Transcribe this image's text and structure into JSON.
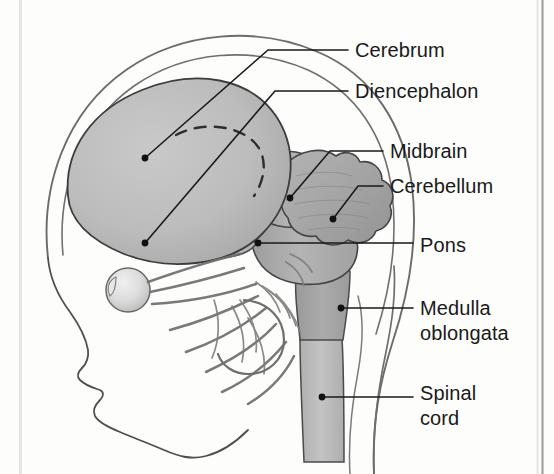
{
  "figure": {
    "background_color": "#fdfdfc",
    "ink_color": "#1a1a1a"
  },
  "palette": {
    "cerebrum_fill": "#b9b9b9",
    "cerebrum_fill_light": "#c7c7c7",
    "brainstem_fill": "#b0b0b0",
    "cerebellum_fill": "#a9a9a9",
    "medulla_fill": "#a6a6a6",
    "spinal_cord_fill": "#bcbcbc",
    "eye_fill": "#dcdcdc",
    "nerve_stroke": "#6f6f6f",
    "skull_stroke": "#5d5d5d",
    "outline_stroke": "#2c2c2c",
    "leader_stroke": "#1a1a1a",
    "frame_line": "#9a9a9a",
    "frame_line_faint": "#dddddd"
  },
  "frame": {
    "left_rule_x": 20,
    "right_rule_x": 542,
    "left_rule_color": "#e3e3e3",
    "right_rule_color": "#a0a0a0"
  },
  "labels": [
    {
      "id": "cerebrum",
      "name": "Cerebrum",
      "lines": [
        "Cerebrum"
      ],
      "text_x": 355,
      "text_y": 38,
      "leader": {
        "dot": [
          145,
          158
        ],
        "elbow": [
          268,
          50
        ],
        "end": [
          348,
          50
        ]
      }
    },
    {
      "id": "diencephalon",
      "name": "Diencephalon",
      "lines": [
        "Diencephalon"
      ],
      "text_x": 355,
      "text_y": 79,
      "leader": {
        "dot": [
          145,
          243
        ],
        "elbow": [
          275,
          91
        ],
        "end": [
          348,
          91
        ]
      }
    },
    {
      "id": "midbrain",
      "name": "Midbrain",
      "lines": [
        "Midbrain"
      ],
      "text_x": 390,
      "text_y": 139,
      "leader": {
        "dot": [
          290,
          198
        ],
        "elbow": [
          330,
          151
        ],
        "end": [
          383,
          151
        ]
      }
    },
    {
      "id": "cerebellum",
      "name": "Cerebellum",
      "lines": [
        "Cerebellum"
      ],
      "text_x": 390,
      "text_y": 174,
      "leader": {
        "dot": [
          333,
          219
        ],
        "elbow": [
          358,
          186
        ],
        "end": [
          383,
          186
        ]
      }
    },
    {
      "id": "pons",
      "name": "Pons",
      "lines": [
        "Pons"
      ],
      "text_x": 420,
      "text_y": 233,
      "leader": {
        "dot": [
          258,
          243
        ],
        "elbow": [
          330,
          243
        ],
        "end": [
          413,
          243
        ]
      }
    },
    {
      "id": "medulla-oblongata",
      "name": "Medulla oblongata",
      "lines": [
        "Medulla",
        "oblongata"
      ],
      "text_x": 420,
      "text_y": 296,
      "leader": {
        "dot": [
          341,
          308
        ],
        "elbow": [
          380,
          308
        ],
        "end": [
          413,
          308
        ]
      }
    },
    {
      "id": "spinal-cord",
      "name": "Spinal cord",
      "lines": [
        "Spinal",
        "cord"
      ],
      "text_x": 420,
      "text_y": 381,
      "leader": {
        "dot": [
          322,
          397
        ],
        "elbow": [
          370,
          397
        ],
        "end": [
          413,
          397
        ]
      }
    }
  ],
  "structures": [
    {
      "id": "skull-outer",
      "name": "skull outer outline"
    },
    {
      "id": "skull-inner",
      "name": "skull inner outline"
    },
    {
      "id": "face-profile",
      "name": "face profile outline"
    },
    {
      "id": "cerebrum",
      "name": "cerebrum"
    },
    {
      "id": "lateral-sulcus",
      "name": "lateral sulcus dashed line"
    },
    {
      "id": "diencephalon",
      "name": "diencephalon"
    },
    {
      "id": "midbrain",
      "name": "midbrain"
    },
    {
      "id": "cerebellum",
      "name": "cerebellum"
    },
    {
      "id": "pons",
      "name": "pons"
    },
    {
      "id": "medulla-oblongata",
      "name": "medulla oblongata"
    },
    {
      "id": "spinal-cord",
      "name": "spinal cord"
    },
    {
      "id": "eyeball",
      "name": "eyeball"
    },
    {
      "id": "cranial-nerves",
      "name": "cranial nerves"
    },
    {
      "id": "neck-outline",
      "name": "neck outline"
    }
  ]
}
